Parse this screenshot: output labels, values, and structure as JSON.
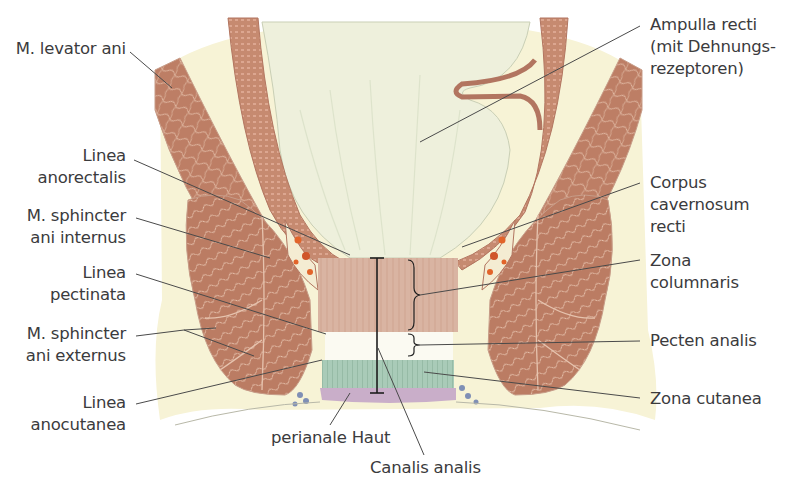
{
  "diagram": {
    "colors": {
      "background": "#ffffff",
      "tissue_cream": "#f7f3d6",
      "muscle": "#bd7e65",
      "muscle_fiber": "#e6c1ab",
      "lumen": "#eef0dc",
      "zona_columnaris": "#d9b4a2",
      "pecten": "#fbfaf2",
      "zona_cutanea": "#a9cbb8",
      "perianal_skin": "#c9aec9",
      "venous_plexus": "#e2642a",
      "glands": "#7f8fb5",
      "leader_line": "#4a4a4a"
    }
  },
  "labels_left": [
    {
      "id": "levator",
      "lines": [
        "M. levator ani"
      ]
    },
    {
      "id": "anorectalis",
      "lines": [
        "Linea",
        "anorectalis"
      ]
    },
    {
      "id": "sph-int",
      "lines": [
        "M. sphincter",
        "ani internus"
      ]
    },
    {
      "id": "pectinata",
      "lines": [
        "Linea",
        "pectinata"
      ]
    },
    {
      "id": "sph-ext",
      "lines": [
        "M. sphincter",
        "ani externus"
      ]
    },
    {
      "id": "anocutanea",
      "lines": [
        "Linea",
        "anocutanea"
      ]
    }
  ],
  "labels_right": [
    {
      "id": "ampulla",
      "lines": [
        "Ampulla recti",
        "(mit Dehnungs-",
        "rezeptoren)"
      ]
    },
    {
      "id": "corpus",
      "lines": [
        "Corpus",
        "cavernosum",
        "recti"
      ]
    },
    {
      "id": "columnaris",
      "lines": [
        "Zona",
        "columnaris"
      ]
    },
    {
      "id": "pecten",
      "lines": [
        "Pecten analis"
      ]
    },
    {
      "id": "cutanea",
      "lines": [
        "Zona cutanea"
      ]
    }
  ],
  "labels_bottom": [
    {
      "id": "perianal",
      "lines": [
        "perianale Haut"
      ]
    },
    {
      "id": "canalis",
      "lines": [
        "Canalis analis"
      ]
    }
  ]
}
